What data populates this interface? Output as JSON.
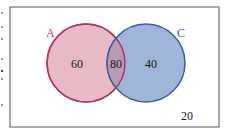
{
  "diagram": {
    "type": "venn",
    "frame": {
      "stroke": "#555555"
    },
    "sets": [
      {
        "id": "A",
        "label": "A",
        "only_value": "60",
        "fill": "#e9b9c6",
        "stroke": "#b0385f",
        "label_color": "#b0385f"
      },
      {
        "id": "C",
        "label": "C",
        "only_value": "40",
        "fill": "#9fb4d8",
        "stroke": "#3f5f9d",
        "label_color": "#3f5f9d"
      }
    ],
    "intersection_value": "80",
    "outside_value": "20",
    "text_color": "#1a1a1a"
  }
}
